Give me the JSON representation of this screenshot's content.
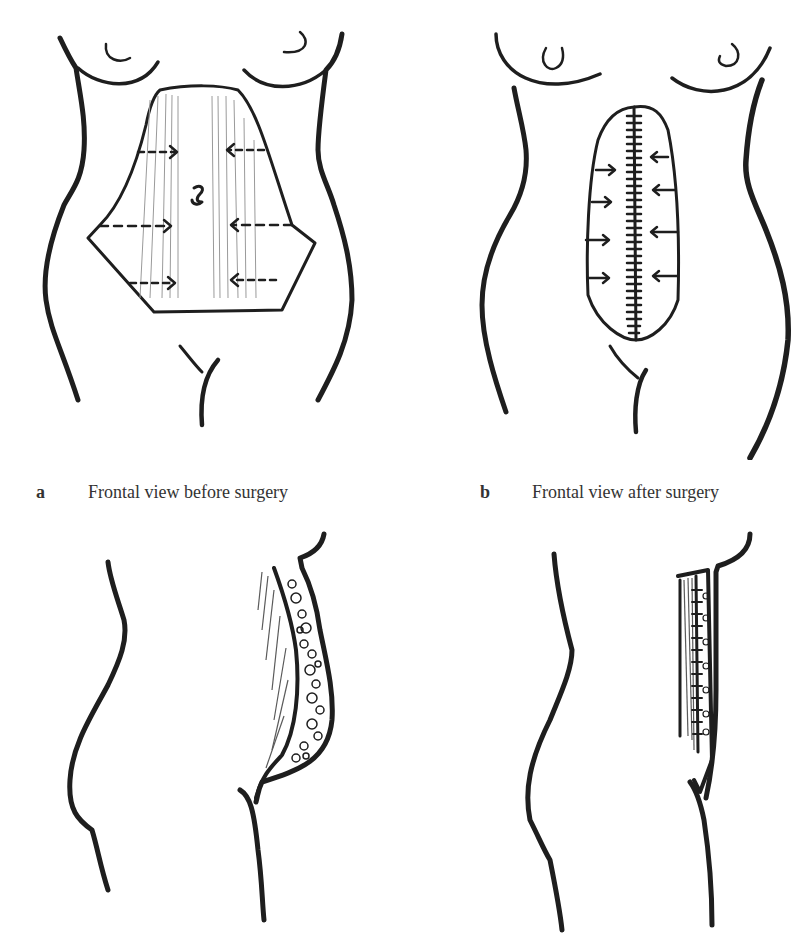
{
  "figure": {
    "panels": [
      {
        "id": "a",
        "letter": "a",
        "caption": "Frontal view before surgery",
        "annotation": "ƨ"
      },
      {
        "id": "b",
        "letter": "b",
        "caption": "Frontal view after surgery"
      },
      {
        "id": "c",
        "description": "lateral view before surgery"
      },
      {
        "id": "d",
        "description": "lateral view after surgery"
      }
    ],
    "colors": {
      "ink": "#1e1e1e",
      "background": "#ffffff",
      "hatch": "#9a9a9a"
    }
  }
}
